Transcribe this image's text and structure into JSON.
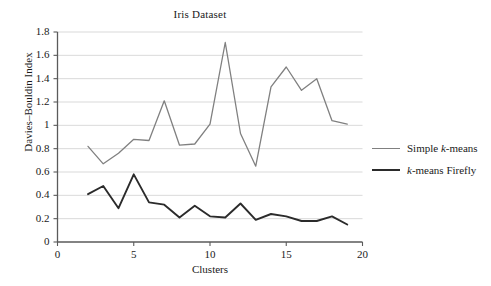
{
  "chart_data": {
    "type": "line",
    "title": "Iris Dataset",
    "xlabel": "Clusters",
    "ylabel": "Davies–Bouldin Index",
    "xlim": [
      0,
      20
    ],
    "ylim": [
      0,
      1.8
    ],
    "grid": "horizontal",
    "legend_position": "right",
    "xticks": [
      "0",
      "5",
      "10",
      "15",
      "20"
    ],
    "xtick_values": [
      0,
      5,
      10,
      15,
      20
    ],
    "yticks": [
      "0",
      "0.2",
      "0.4",
      "0.6",
      "0.8",
      "1",
      "1.2",
      "1.4",
      "1.6",
      "1.8"
    ],
    "ytick_values": [
      0,
      0.2,
      0.4,
      0.6,
      0.8,
      1.0,
      1.2,
      1.4,
      1.6,
      1.8
    ],
    "x": [
      2,
      3,
      4,
      5,
      6,
      7,
      8,
      9,
      10,
      11,
      12,
      13,
      14,
      15,
      16,
      17,
      18,
      19
    ],
    "series": [
      {
        "name": "Simple k-means",
        "name_plain": "Simple k-means",
        "color": "#808080",
        "values": [
          0.82,
          0.67,
          0.76,
          0.88,
          0.87,
          1.21,
          0.83,
          0.84,
          1.01,
          1.71,
          0.93,
          0.65,
          1.33,
          1.5,
          1.3,
          1.4,
          1.04,
          1.01
        ]
      },
      {
        "name": "k-means Firefly",
        "name_plain": "k-means Firefly",
        "color": "#2b2b2b",
        "values": [
          0.41,
          0.48,
          0.29,
          0.58,
          0.34,
          0.32,
          0.21,
          0.31,
          0.22,
          0.21,
          0.33,
          0.19,
          0.24,
          0.22,
          0.18,
          0.18,
          0.22,
          0.15
        ]
      }
    ]
  },
  "legend": {
    "items": [
      {
        "prefix": "Simple ",
        "italic": "k",
        "suffix": "-means",
        "color": "#808080",
        "width": 1.4
      },
      {
        "prefix": "",
        "italic": "k",
        "suffix": "-means Firefly",
        "color": "#2b2b2b",
        "width": 2.0
      }
    ]
  },
  "axes": {
    "axis_color": "#5a5a5a",
    "grid_color": "#cfcfcf"
  }
}
